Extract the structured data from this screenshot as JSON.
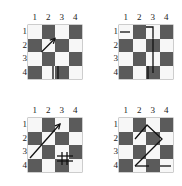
{
  "figure": {
    "title": "",
    "panel_count": 4,
    "board_size": 4,
    "colors": {
      "light_square": "#f7f7f7",
      "dark_square": "#5b5b5b",
      "annotation": "#111111",
      "label_text": "#1a1a1a",
      "background": "#ffffff"
    }
  },
  "labels": {
    "columns": [
      "1",
      "2",
      "3",
      "4"
    ],
    "rows": [
      "1",
      "2",
      "3",
      "4"
    ]
  },
  "panels": [
    {
      "id": "panel-top-left",
      "name": "board-1",
      "squares": [
        [
          "light",
          "dark",
          "light",
          "dark"
        ],
        [
          "dark",
          "light",
          "dark",
          "light"
        ],
        [
          "light",
          "dark",
          "light",
          "dark"
        ],
        [
          "dark",
          "light",
          "dark",
          "light"
        ]
      ],
      "annotations": [
        {
          "name": "diagonal-arrow-up-right",
          "type": "arrow",
          "points": "13.5,27 27,13.5"
        },
        {
          "name": "vertical-tick-left-r3c3",
          "type": "segment",
          "points": "25,41 25,54"
        },
        {
          "name": "vertical-tick-right-r3c3",
          "type": "segment",
          "points": "30,41 30,54"
        },
        {
          "name": "horizontal-tick-r4c2",
          "type": "segment",
          "points": "14,61 27,61"
        },
        {
          "name": "horizontal-tick-r4c4",
          "type": "segment",
          "points": "41,61 54,61"
        }
      ]
    },
    {
      "id": "panel-top-right",
      "name": "board-2",
      "squares": [
        [
          "light",
          "dark",
          "light",
          "dark"
        ],
        [
          "dark",
          "light",
          "dark",
          "light"
        ],
        [
          "light",
          "dark",
          "light",
          "dark"
        ],
        [
          "dark",
          "light",
          "dark",
          "light"
        ]
      ],
      "annotations": [
        {
          "name": "horizontal-tick-r1c1",
          "type": "segment",
          "points": "1,7 11,7"
        },
        {
          "name": "bent-path-top",
          "type": "polyline",
          "points": "27,2 34,2 34,13.5"
        },
        {
          "name": "vertical-line-long",
          "type": "segment",
          "points": "34,13.5 34,48"
        },
        {
          "name": "vertical-line-short",
          "type": "segment",
          "points": "29,41 29,54"
        }
      ]
    },
    {
      "id": "panel-bottom-left",
      "name": "board-3",
      "squares": [
        [
          "light",
          "dark",
          "light",
          "dark"
        ],
        [
          "dark",
          "light",
          "dark",
          "light"
        ],
        [
          "light",
          "dark",
          "light",
          "dark"
        ],
        [
          "dark",
          "light",
          "dark",
          "light"
        ]
      ],
      "annotations": [
        {
          "name": "long-diagonal-arrow-up-right",
          "type": "arrow",
          "points": "2,40 32,6"
        },
        {
          "name": "cross-vertical-r3c3",
          "type": "segment",
          "points": "34,34 34,47"
        },
        {
          "name": "cross-vertical-2-r3c3",
          "type": "segment",
          "points": "39,34 39,47"
        },
        {
          "name": "cross-horizontal-r3c3",
          "type": "segment",
          "points": "29,38 45,38"
        },
        {
          "name": "cross-horizontal-2-r3c3",
          "type": "segment",
          "points": "29,43 45,43"
        }
      ]
    },
    {
      "id": "panel-bottom-right",
      "name": "board-4",
      "squares": [
        [
          "light",
          "dark",
          "light",
          "dark"
        ],
        [
          "dark",
          "light",
          "dark",
          "light"
        ],
        [
          "light",
          "dark",
          "light",
          "dark"
        ],
        [
          "dark",
          "light",
          "dark",
          "light"
        ]
      ],
      "annotations": [
        {
          "name": "zigzag-path",
          "type": "polyline",
          "points": "16,21 28,7 43,21 16,48"
        },
        {
          "name": "horizontal-tick-r4c4",
          "type": "segment",
          "points": "16,48 30,48"
        },
        {
          "name": "horizontal-tick-end",
          "type": "segment",
          "points": "41,48 52,48"
        }
      ]
    }
  ]
}
